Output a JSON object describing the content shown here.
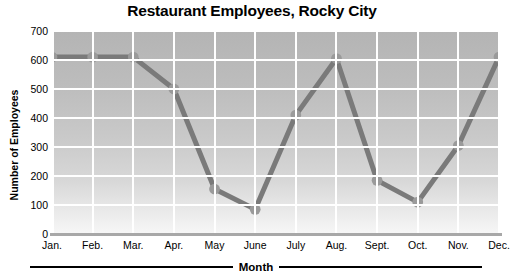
{
  "chart_data": {
    "type": "line",
    "title": "Restaurant Employees, Rocky City",
    "xlabel": "Month",
    "ylabel": "Number of Employees",
    "categories": [
      "Jan.",
      "Feb.",
      "Mar.",
      "Apr.",
      "May",
      "June",
      "July",
      "Aug.",
      "Sept.",
      "Oct.",
      "Nov.",
      "Dec."
    ],
    "values": [
      610,
      610,
      610,
      500,
      155,
      85,
      410,
      605,
      185,
      110,
      305,
      610
    ],
    "ylim": [
      0,
      700
    ],
    "yticks": [
      0,
      100,
      200,
      300,
      400,
      500,
      600,
      700
    ],
    "ytick_labels": [
      "0",
      "100",
      "200",
      "300",
      "400",
      "500",
      "600",
      "700"
    ],
    "grid": true,
    "legend": false,
    "series_color": "#7a7a7a",
    "marker_color": "#9a9a9a",
    "plot_background": "#c4c4c4",
    "gridline_color": "#ffffff",
    "text_color": "#000000"
  }
}
